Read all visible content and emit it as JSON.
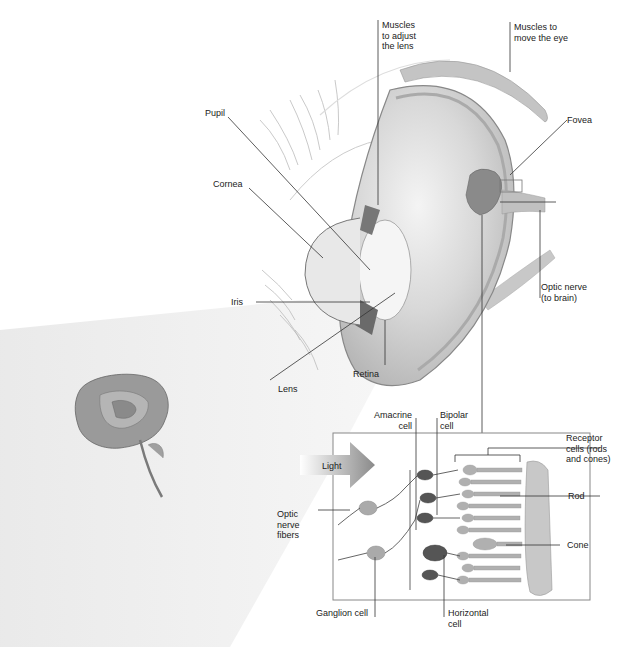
{
  "diagram": {
    "eye_labels": {
      "muscles_lens": "Muscles\nto adjust\nthe lens",
      "muscles_eye": "Muscles to\nmove the eye",
      "pupil": "Pupil",
      "fovea": "Fovea",
      "cornea": "Cornea",
      "iris": "Iris",
      "optic_nerve": "Optic nerve\n(to brain)",
      "lens": "Lens",
      "retina": "Retina"
    },
    "retina_labels": {
      "amacrine": "Amacrine\ncell",
      "bipolar": "Bipolar\ncell",
      "receptor": "Receptor\ncells (rods\nand cones)",
      "light": "Light",
      "rod": "Rod",
      "optic_fibers": "Optic\nnerve\nfibers",
      "cone": "Cone",
      "ganglion": "Ganglion cell",
      "horizontal": "Horizontal\ncell"
    },
    "colors": {
      "line": "#333333",
      "eye_shade": "#9a9a9a",
      "light_beam": "#eeeeee",
      "cell_dark": "#555555",
      "cell_light": "#a8a8a8",
      "box_border": "#888888"
    }
  }
}
